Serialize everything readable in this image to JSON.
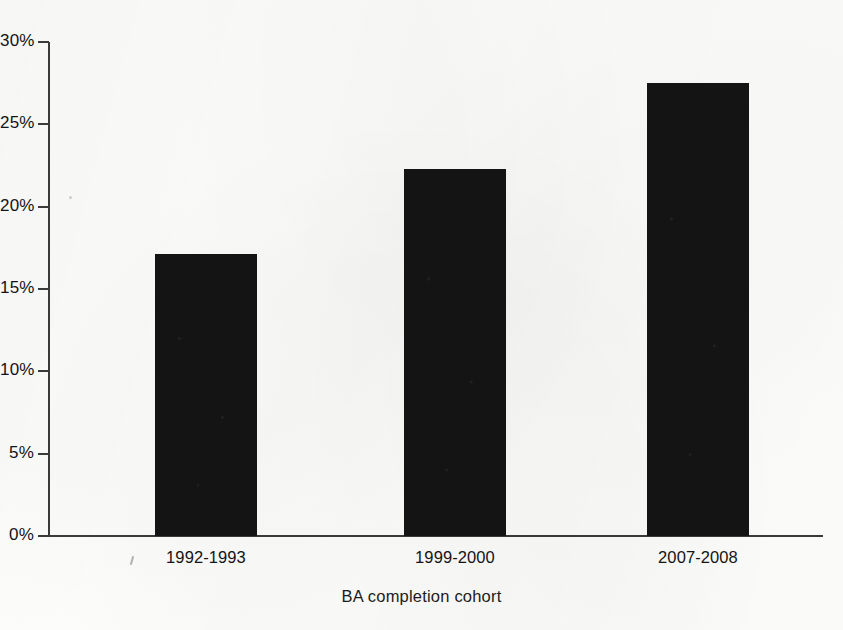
{
  "chart_data": {
    "type": "bar",
    "title": "",
    "subtitle": "",
    "xlabel": "BA completion cohort",
    "ylabel": "",
    "categories": [
      "1992-1993",
      "1999-2000",
      "2007-2008"
    ],
    "values": [
      17.1,
      22.3,
      27.5
    ],
    "value_format": "percent",
    "ylim": [
      0,
      30
    ],
    "ytick_labels": [
      "0%",
      "5%",
      "10%",
      "15%",
      "20%",
      "25%",
      "30%"
    ],
    "ytick_values": [
      0,
      5,
      10,
      15,
      20,
      25,
      30
    ],
    "grid": false,
    "legend": false,
    "legend_position": "none",
    "series": [
      {
        "name": "",
        "values": [
          17.1,
          22.3,
          27.5
        ],
        "color": "#141414"
      }
    ],
    "annotations": []
  },
  "colors": {
    "bar": "#141414",
    "axis": "#3a3a3a",
    "text": "#141414",
    "background": "#fdfdfc"
  }
}
